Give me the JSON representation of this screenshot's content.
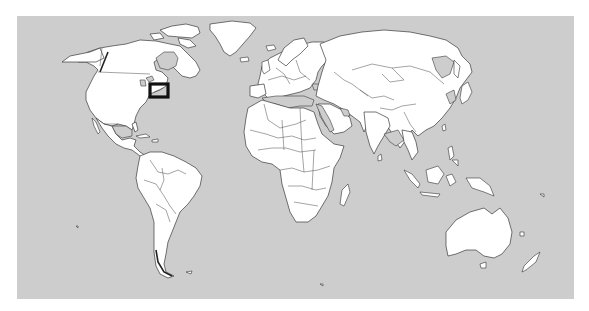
{
  "figure": {
    "type": "world-locator-map",
    "colors": {
      "ocean": "#cdcdcd",
      "land": "#ffffff",
      "borders": "#3a3a3a",
      "locator_box": "#111111"
    },
    "locator": {
      "description": "Black rectangle highlighting northeastern United States coast",
      "region": "Northeastern USA (New York / New England area)"
    },
    "continents": [
      "North America",
      "South America",
      "Europe",
      "Africa",
      "Asia",
      "Australia",
      "Greenland",
      "New Zealand"
    ]
  }
}
